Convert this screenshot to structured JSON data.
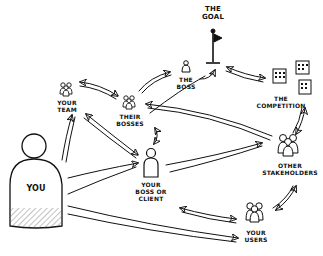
{
  "diagram": {
    "type": "stakeholder-map",
    "style": "hand-drawn sketch, black ink on white",
    "nodes": [
      {
        "id": "goal",
        "label": "THE GOAL",
        "icon": "flag-icon"
      },
      {
        "id": "boss",
        "label": "THE BOSS",
        "icon": "person-icon"
      },
      {
        "id": "competition",
        "label": "THE COMPETITION",
        "icon": "buildings-icon"
      },
      {
        "id": "your_team",
        "label": "YOUR TEAM",
        "icon": "group-icon"
      },
      {
        "id": "their_bosses",
        "label": "THEIR BOSSES",
        "icon": "group-icon"
      },
      {
        "id": "you",
        "label": "YOU",
        "icon": "person-large-icon"
      },
      {
        "id": "your_boss_or_client",
        "label": "YOUR BOSS OR CLIENT",
        "icon": "person-icon"
      },
      {
        "id": "other_stakeholders",
        "label": "OTHER STAKEHOLDERS",
        "icon": "group-icon"
      },
      {
        "id": "your_users",
        "label": "YOUR USERS",
        "icon": "group-icon"
      }
    ],
    "edges": [
      {
        "from": "your_team",
        "to": "their_bosses",
        "bidirectional": true
      },
      {
        "from": "their_bosses",
        "to": "boss",
        "bidirectional": false
      },
      {
        "from": "boss",
        "to": "goal",
        "bidirectional": false
      },
      {
        "from": "goal",
        "to": "competition",
        "bidirectional": true
      },
      {
        "from": "competition",
        "to": "other_stakeholders",
        "bidirectional": true
      },
      {
        "from": "other_stakeholders",
        "to": "their_bosses",
        "bidirectional": false
      },
      {
        "from": "their_bosses",
        "to": "your_boss_or_client",
        "bidirectional": true
      },
      {
        "from": "your_team",
        "to": "your_boss_or_client",
        "bidirectional": true
      },
      {
        "from": "you",
        "to": "your_team",
        "bidirectional": false
      },
      {
        "from": "you",
        "to": "your_boss_or_client",
        "bidirectional": false
      },
      {
        "from": "you",
        "to": "goal",
        "bidirectional": false
      },
      {
        "from": "your_boss_or_client",
        "to": "other_stakeholders",
        "bidirectional": false
      },
      {
        "from": "you",
        "to": "your_users",
        "bidirectional": false
      },
      {
        "from": "your_boss_or_client",
        "to": "your_users",
        "bidirectional": true
      },
      {
        "from": "other_stakeholders",
        "to": "your_users",
        "bidirectional": true
      }
    ]
  },
  "labels": {
    "goal_1": "THE",
    "goal_2": "GOAL",
    "boss_1": "THE",
    "boss_2": "BOSS",
    "competition_1": "THE",
    "competition_2": "COMPETITION",
    "team_1": "YOUR",
    "team_2": "TEAM",
    "bosses_1": "THEIR",
    "bosses_2": "BOSSES",
    "you": "YOU",
    "client_1": "YOUR",
    "client_2": "BOSS OR",
    "client_3": "CLIENT",
    "stake_1": "OTHER",
    "stake_2": "STAKEHOLDERS",
    "users_1": "YOUR",
    "users_2": "USERS"
  },
  "colors": {
    "ink": "#111111",
    "background": "#ffffff",
    "hatch": "#555555"
  }
}
